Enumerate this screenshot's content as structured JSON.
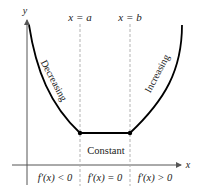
{
  "figure": {
    "type": "function-monotonicity-diagram",
    "axes": {
      "x_label": "x",
      "y_label": "y"
    },
    "vertical_lines": [
      {
        "label": "x = a",
        "position": "a"
      },
      {
        "label": "x = b",
        "position": "b"
      }
    ],
    "curve_labels": {
      "left": "Decreasing",
      "middle": "Constant",
      "right": "Increasing"
    },
    "interval_labels": [
      "f′(x) < 0",
      "f′(x) = 0",
      "f′(x) > 0"
    ],
    "colors": {
      "curve": "#000000",
      "axis": "#555555",
      "dashed": "#999999",
      "text": "#222222"
    }
  }
}
